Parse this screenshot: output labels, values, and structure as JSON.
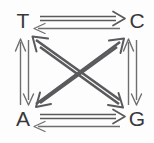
{
  "diagram": {
    "type": "directed-graph",
    "background_color": "#fdfdfd",
    "stroke_color": "#5a5a5c",
    "label_color": "#38383a",
    "nodes": [
      {
        "id": "T",
        "label": "T",
        "x": 23,
        "y": 21
      },
      {
        "id": "C",
        "label": "C",
        "x": 137,
        "y": 21
      },
      {
        "id": "A",
        "label": "A",
        "x": 23,
        "y": 119
      },
      {
        "id": "G",
        "label": "G",
        "x": 137,
        "y": 119
      }
    ],
    "edges": [
      {
        "id": "T-to-C",
        "from": "T",
        "to": "C",
        "style": "thick-double-line",
        "direction": "right"
      },
      {
        "id": "C-to-T",
        "from": "C",
        "to": "T",
        "style": "thin-line",
        "direction": "left"
      },
      {
        "id": "A-to-G",
        "from": "A",
        "to": "G",
        "style": "thick-double-line",
        "direction": "right"
      },
      {
        "id": "G-to-A",
        "from": "G",
        "to": "A",
        "style": "thin-line",
        "direction": "left"
      },
      {
        "id": "A-to-T",
        "from": "A",
        "to": "T",
        "style": "thin-line",
        "direction": "up"
      },
      {
        "id": "T-to-A",
        "from": "T",
        "to": "A",
        "style": "thin-line",
        "direction": "down"
      },
      {
        "id": "G-to-C",
        "from": "G",
        "to": "C",
        "style": "thin-line",
        "direction": "up"
      },
      {
        "id": "C-to-G",
        "from": "C",
        "to": "G",
        "style": "thin-line",
        "direction": "down"
      },
      {
        "id": "G-to-T",
        "from": "G",
        "to": "T",
        "style": "thick-line",
        "direction": "up-left"
      },
      {
        "id": "T-to-G",
        "from": "T",
        "to": "G",
        "style": "thick-line",
        "direction": "down-right"
      },
      {
        "id": "A-to-C",
        "from": "A",
        "to": "C",
        "style": "thick-line",
        "direction": "up-right"
      },
      {
        "id": "C-to-A",
        "from": "C",
        "to": "A",
        "style": "thick-line",
        "direction": "down-left"
      }
    ]
  }
}
